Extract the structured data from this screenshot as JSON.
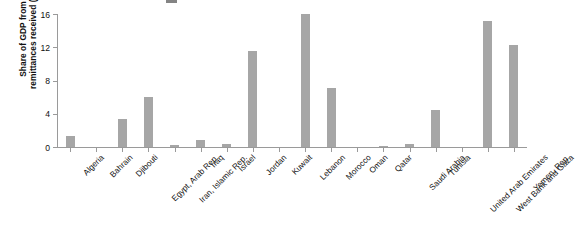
{
  "chart_data": {
    "type": "bar",
    "title": "",
    "xlabel": "",
    "ylabel": "Share of GDP from\nremittances received (%)",
    "ylim": [
      0,
      16
    ],
    "yticks": [
      0,
      4,
      8,
      12,
      16
    ],
    "grid": false,
    "legend": "none",
    "bar_color": "#a6a6a6",
    "axis_color": "#9a9a9a",
    "categories": [
      "Algeria",
      "Bahrain",
      "Djibouti",
      "Egypt, Arab Rep.",
      "Iran, Islamic Rep.",
      "Iraq",
      "Israel",
      "Jordan",
      "Kuwait",
      "Lebanon",
      "Morocco",
      "Oman",
      "Qatar",
      "Saudi Arabia",
      "Tunisia",
      "United Arab Emirates",
      "West Bank and Gaza",
      "Yemen, Rep."
    ],
    "values": [
      1.3,
      0.0,
      3.4,
      6.0,
      0.3,
      0.8,
      0.4,
      11.5,
      0.0,
      16.0,
      7.1,
      0.0,
      0.1,
      0.4,
      4.5,
      0.0,
      15.2,
      12.3
    ]
  }
}
